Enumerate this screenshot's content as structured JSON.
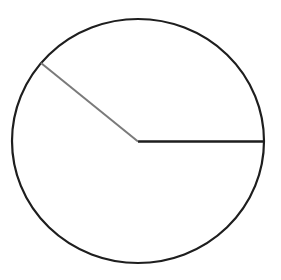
{
  "diagram": {
    "type": "circle-with-radii",
    "canvas": {
      "width": 281,
      "height": 280,
      "background": "#ffffff"
    },
    "circle": {
      "cx": 138,
      "cy": 141,
      "rx": 126,
      "ry": 122,
      "stroke": "#1e1e1e",
      "stroke_width": 2.2
    },
    "radii": [
      {
        "id": "horizontal-radius",
        "x1": 138,
        "y1": 141.5,
        "x2": 264,
        "y2": 141.5,
        "stroke": "#1e1e1e",
        "stroke_width": 2.4
      },
      {
        "id": "slanted-radius",
        "x1": 138,
        "y1": 141.5,
        "x2": 41,
        "y2": 63,
        "stroke": "#7a7a7a",
        "stroke_width": 2
      }
    ],
    "labels": []
  }
}
